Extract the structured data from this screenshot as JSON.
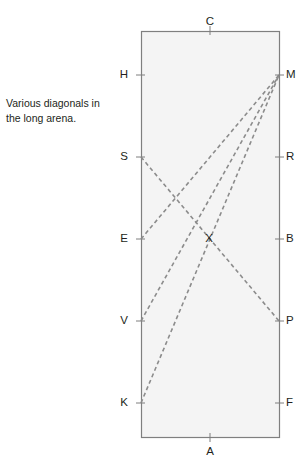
{
  "header_sliver": {
    "text": "· · · ·"
  },
  "caption": {
    "line1": "Various diagonals in",
    "line2": "the long arena."
  },
  "diagram": {
    "title": "Various diagonals in the long arena.",
    "rect": {
      "x": 141,
      "y": 31,
      "width": 138,
      "height": 406,
      "fill": "#f4f4f4",
      "stroke": "#7f7f7f",
      "stroke_width": 1.2
    },
    "styles": {
      "dash_color": "#8c8c8c",
      "dash_width": 1.6,
      "dash_pattern": "4,3",
      "tick_color": "#7f7f7f",
      "label_color": "#231f20"
    },
    "points": [
      {
        "id": "C",
        "label": "C",
        "x": 210,
        "y": 31,
        "side": "top",
        "label_x": 204,
        "label_y": 16
      },
      {
        "id": "H",
        "label": "H",
        "x": 141,
        "y": 75,
        "side": "left",
        "label_x": 112,
        "label_y": 69
      },
      {
        "id": "M",
        "label": "M",
        "x": 279,
        "y": 75,
        "side": "right",
        "label_x": 286,
        "label_y": 69
      },
      {
        "id": "S",
        "label": "S",
        "x": 141,
        "y": 157,
        "side": "left",
        "label_x": 112,
        "label_y": 151
      },
      {
        "id": "R",
        "label": "R",
        "x": 279,
        "y": 157,
        "side": "right",
        "label_x": 286,
        "label_y": 151
      },
      {
        "id": "E",
        "label": "E",
        "x": 141,
        "y": 239,
        "side": "left",
        "label_x": 112,
        "label_y": 233
      },
      {
        "id": "B",
        "label": "B",
        "x": 279,
        "y": 239,
        "side": "right",
        "label_x": 286,
        "label_y": 233
      },
      {
        "id": "V",
        "label": "V",
        "x": 141,
        "y": 321,
        "side": "left",
        "label_x": 112,
        "label_y": 315
      },
      {
        "id": "P",
        "label": "P",
        "x": 279,
        "y": 321,
        "side": "right",
        "label_x": 286,
        "label_y": 315
      },
      {
        "id": "K",
        "label": "K",
        "x": 141,
        "y": 403,
        "side": "left",
        "label_x": 112,
        "label_y": 397
      },
      {
        "id": "F",
        "label": "F",
        "x": 279,
        "y": 403,
        "side": "right",
        "label_x": 286,
        "label_y": 397
      },
      {
        "id": "A",
        "label": "A",
        "x": 210,
        "y": 437,
        "side": "bottom",
        "label_x": 204,
        "label_y": 446
      },
      {
        "id": "X",
        "label": "X",
        "x": 208,
        "y": 239,
        "side": "interior",
        "label_x": 203,
        "label_y": 233
      }
    ],
    "diagonals": [
      {
        "id": "E-M",
        "from": "E",
        "to": "M",
        "x1": 141,
        "y1": 239,
        "x2": 279,
        "y2": 75
      },
      {
        "id": "V-M",
        "from": "V",
        "to": "M",
        "x1": 141,
        "y1": 321,
        "x2": 279,
        "y2": 75
      },
      {
        "id": "K-M",
        "from": "K",
        "to": "M",
        "x1": 141,
        "y1": 403,
        "x2": 279,
        "y2": 75
      },
      {
        "id": "S-P",
        "from": "S",
        "to": "P",
        "x1": 141,
        "y1": 157,
        "x2": 279,
        "y2": 321
      }
    ]
  }
}
